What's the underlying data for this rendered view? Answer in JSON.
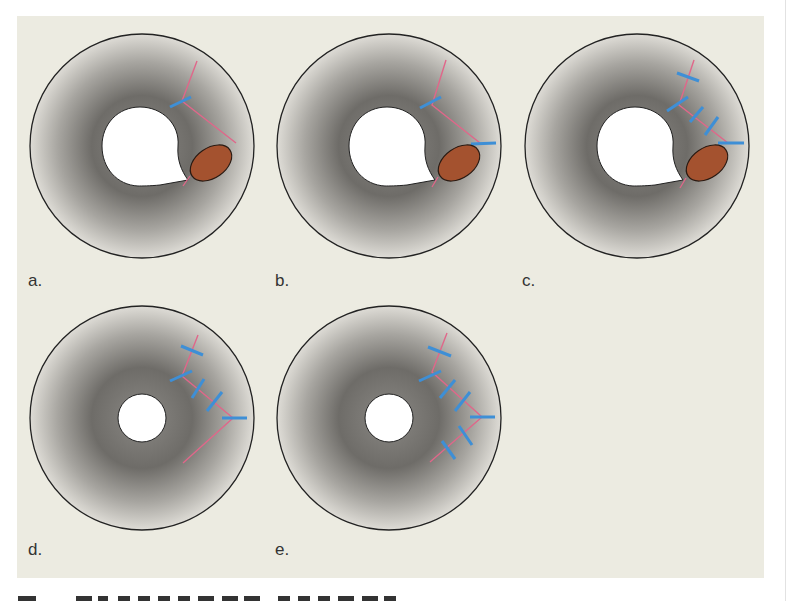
{
  "figure": {
    "background_color": "#ecebe1",
    "ring_edge_color": "#222222",
    "ring_shade_dark": "#6e6c68",
    "ring_shade_light": "#dcdbd6",
    "suture_track_color": "#e0678a",
    "suture_stitch_color": "#3e8fd6",
    "ellipse_fill": "#a4522f",
    "panels": [
      {
        "id": "a",
        "label": "a.",
        "hole": "teardrop",
        "stitches": 1,
        "has_lesion": true
      },
      {
        "id": "b",
        "label": "b.",
        "hole": "teardrop",
        "stitches": 2,
        "has_lesion": true
      },
      {
        "id": "c",
        "label": "c.",
        "hole": "teardrop",
        "stitches": 5,
        "has_lesion": true
      },
      {
        "id": "d",
        "label": "d.",
        "hole": "round",
        "stitches": 5,
        "has_lesion": false
      },
      {
        "id": "e",
        "label": "e.",
        "hole": "round",
        "stitches": 7,
        "has_lesion": false
      }
    ]
  },
  "caption": {
    "text": "",
    "note": "caption clipped at bottom edge"
  }
}
